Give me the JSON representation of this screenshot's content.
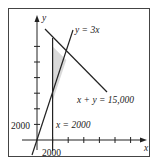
{
  "diagram": {
    "axes": {
      "x_label": "x",
      "y_label": "y"
    },
    "lines": [
      {
        "equation": "y = 3x",
        "label": "y = 3x"
      },
      {
        "equation": "x + y = 15,000",
        "label": "x + y = 15,000"
      },
      {
        "equation": "x = 2000",
        "label": "x = 2000"
      }
    ],
    "tick_labels": {
      "x": "2000",
      "y": "2000"
    },
    "tick_spacing": 2000,
    "shaded_region": "triangle bounded by x = 2000, y = 3x, and x + y = 15,000",
    "colors": {
      "line": "#222222",
      "shade": "#d9d9d9",
      "frame": "#444444"
    }
  }
}
